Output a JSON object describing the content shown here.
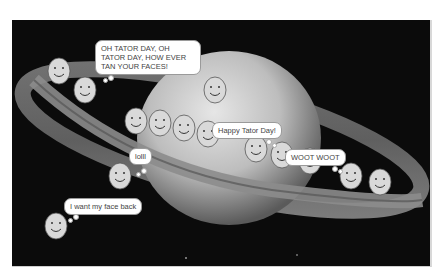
{
  "scene": {
    "title": "Saturn Tator Day animation",
    "background_color": "#0b0b0b",
    "planet": "saturn"
  },
  "bubbles": [
    {
      "id": "oh-tator",
      "text": "OH TATOR DAY, OH TATOR DAY, HOW EVER TAN YOUR FACES!",
      "type": "speech"
    },
    {
      "id": "happy",
      "text": "Happy Tator Day!",
      "type": "speech"
    },
    {
      "id": "lolll",
      "text": "lolll",
      "type": "thought"
    },
    {
      "id": "woot",
      "text": "WOOT WOOT",
      "type": "thought"
    },
    {
      "id": "face-back",
      "text": "I want my face back",
      "type": "thought"
    }
  ],
  "faces": [
    {
      "x": 47,
      "y": 57
    },
    {
      "x": 73,
      "y": 76
    },
    {
      "x": 203,
      "y": 76
    },
    {
      "x": 124,
      "y": 107
    },
    {
      "x": 148,
      "y": 109
    },
    {
      "x": 172,
      "y": 114
    },
    {
      "x": 196,
      "y": 120
    },
    {
      "x": 244,
      "y": 135
    },
    {
      "x": 270,
      "y": 141
    },
    {
      "x": 298,
      "y": 147
    },
    {
      "x": 108,
      "y": 162
    },
    {
      "x": 339,
      "y": 162
    },
    {
      "x": 368,
      "y": 168
    },
    {
      "x": 44,
      "y": 212
    }
  ]
}
